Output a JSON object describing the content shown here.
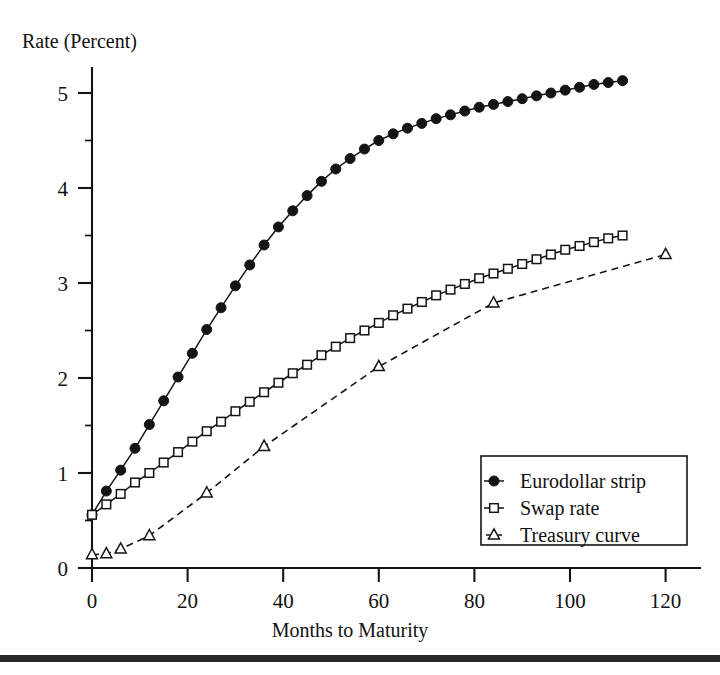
{
  "chart_data": {
    "type": "line",
    "title": "",
    "xlabel": "Months to Maturity",
    "ylabel": "Rate (Percent)",
    "xlim": [
      0,
      128
    ],
    "ylim": [
      0,
      5.35
    ],
    "xticks": [
      0,
      20,
      40,
      60,
      80,
      100,
      120
    ],
    "xtick_labels": [
      "0",
      "20",
      "40",
      "60",
      "80",
      "100",
      "120"
    ],
    "yticks": [
      0,
      1,
      2,
      3,
      4,
      5
    ],
    "ytick_labels": [
      "0",
      "1",
      "2",
      "3",
      "4",
      "5"
    ],
    "grid": false,
    "legend_position": "lower-right",
    "series": [
      {
        "name": "Eurodollar strip",
        "marker": "filled-circle",
        "line": "solid",
        "color": "#141414",
        "x": [
          0,
          3,
          6,
          9,
          12,
          15,
          18,
          21,
          24,
          27,
          30,
          33,
          36,
          39,
          42,
          45,
          48,
          51,
          54,
          57,
          60,
          63,
          66,
          69,
          72,
          75,
          78,
          81,
          84,
          87,
          90,
          93,
          96,
          99,
          102,
          105,
          108,
          111
        ],
        "y": [
          0.56,
          0.81,
          1.03,
          1.26,
          1.51,
          1.76,
          2.01,
          2.26,
          2.51,
          2.74,
          2.97,
          3.19,
          3.4,
          3.59,
          3.76,
          3.92,
          4.07,
          4.2,
          4.31,
          4.41,
          4.5,
          4.57,
          4.63,
          4.68,
          4.73,
          4.77,
          4.81,
          4.85,
          4.88,
          4.91,
          4.94,
          4.97,
          5.0,
          5.03,
          5.06,
          5.09,
          5.11,
          5.13
        ]
      },
      {
        "name": "Swap rate",
        "marker": "open-square",
        "line": "solid",
        "color": "#141414",
        "x": [
          0,
          3,
          6,
          9,
          12,
          15,
          18,
          21,
          24,
          27,
          30,
          33,
          36,
          39,
          42,
          45,
          48,
          51,
          54,
          57,
          60,
          63,
          66,
          69,
          72,
          75,
          78,
          81,
          84,
          87,
          90,
          93,
          96,
          99,
          102,
          105,
          108,
          111
        ],
        "y": [
          0.56,
          0.67,
          0.78,
          0.9,
          1.0,
          1.11,
          1.22,
          1.33,
          1.44,
          1.54,
          1.65,
          1.75,
          1.85,
          1.95,
          2.05,
          2.14,
          2.24,
          2.33,
          2.42,
          2.5,
          2.58,
          2.66,
          2.73,
          2.8,
          2.87,
          2.93,
          2.99,
          3.05,
          3.1,
          3.15,
          3.2,
          3.25,
          3.3,
          3.35,
          3.39,
          3.43,
          3.47,
          3.5
        ]
      },
      {
        "name": "Treasury curve",
        "marker": "open-triangle",
        "line": "dashed",
        "color": "#141414",
        "x": [
          0,
          3,
          6,
          12,
          24,
          36,
          60,
          84,
          120
        ],
        "y": [
          0.14,
          0.15,
          0.2,
          0.34,
          0.79,
          1.28,
          2.12,
          2.79,
          3.3
        ]
      }
    ]
  },
  "legend": {
    "entries": [
      {
        "label": "Eurodollar strip",
        "marker": "filled-circle",
        "line": "solid"
      },
      {
        "label": "Swap rate",
        "marker": "open-square",
        "line": "solid"
      },
      {
        "label": "Treasury curve",
        "marker": "open-triangle",
        "line": "dashed"
      }
    ]
  },
  "colors": {
    "ink": "#141414",
    "background": "#ffffff",
    "rule": "#2a2a2a"
  }
}
